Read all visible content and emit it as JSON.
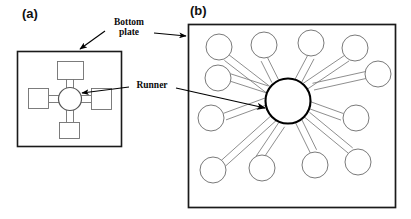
{
  "figure": {
    "panels": [
      {
        "id": "panel-a",
        "label": "(a)",
        "description": "four-arm runner and bottom plate",
        "plate": {
          "x": 17,
          "y": 51,
          "width": 105,
          "height": 96
        },
        "hub": {
          "cx": 70,
          "cy": 99,
          "r": 12
        },
        "arms": [
          {
            "name": "arm-top",
            "angle_deg": 270,
            "pad": {
              "x": 57,
              "y": 61,
              "width": 27,
              "height": 18
            }
          },
          {
            "name": "arm-right",
            "angle_deg": 0,
            "pad": {
              "x": 91,
              "y": 88,
              "width": 21,
              "height": 22
            }
          },
          {
            "name": "arm-bottom",
            "angle_deg": 90,
            "pad": {
              "x": 59,
              "y": 122,
              "width": 21,
              "height": 17
            }
          },
          {
            "name": "arm-left",
            "angle_deg": 180,
            "pad": {
              "x": 28,
              "y": 88,
              "width": 21,
              "height": 21
            }
          }
        ]
      },
      {
        "id": "panel-b",
        "label": "(b)",
        "description": "twelve-arm radial runner and bottom plate",
        "plate": {
          "x": 188,
          "y": 24,
          "width": 208,
          "height": 184
        },
        "hub": {
          "cx": 288,
          "cy": 101,
          "r": 23
        },
        "satellite_radius": 13,
        "satellites": [
          {
            "name": "cavity-1",
            "cx": 219,
            "cy": 47
          },
          {
            "name": "cavity-2",
            "cx": 264,
            "cy": 45
          },
          {
            "name": "cavity-3",
            "cx": 311,
            "cy": 43
          },
          {
            "name": "cavity-4",
            "cx": 355,
            "cy": 48
          },
          {
            "name": "cavity-5",
            "cx": 218,
            "cy": 78
          },
          {
            "name": "cavity-6",
            "cx": 378,
            "cy": 74
          },
          {
            "name": "cavity-7",
            "cx": 211,
            "cy": 118
          },
          {
            "name": "cavity-8",
            "cx": 356,
            "cy": 118
          },
          {
            "name": "cavity-9",
            "cx": 213,
            "cy": 170
          },
          {
            "name": "cavity-10",
            "cx": 262,
            "cy": 168
          },
          {
            "name": "cavity-11",
            "cx": 315,
            "cy": 165
          },
          {
            "name": "cavity-12",
            "cx": 358,
            "cy": 162
          }
        ]
      }
    ],
    "annotations": [
      {
        "id": "bottom-plate",
        "text": "Bottom\nplate",
        "line1": "Bottom",
        "line2": "plate",
        "leaders": [
          {
            "name": "leader-to-panel-a",
            "x1": 105,
            "y1": 31,
            "x2": 79,
            "y2": 49
          },
          {
            "name": "leader-to-panel-b",
            "x1": 154,
            "y1": 33,
            "x2": 186,
            "y2": 37
          }
        ]
      },
      {
        "id": "runner",
        "text": "Runner",
        "leaders": [
          {
            "name": "leader-to-panel-a",
            "x1": 129,
            "y1": 87,
            "x2": 81,
            "y2": 92
          },
          {
            "name": "leader-to-panel-b",
            "x1": 175,
            "y1": 88,
            "x2": 264,
            "y2": 108
          }
        ]
      }
    ],
    "colors": {
      "background": "#ffffff",
      "plate_stroke": "#1a1a1a",
      "runner_stroke": "#6b6b6b",
      "hub_stroke": "#000000",
      "annotation_stroke": "#000000",
      "text": "#111111"
    }
  }
}
